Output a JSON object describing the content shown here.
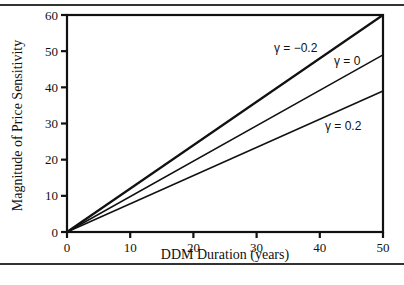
{
  "chart_data": {
    "type": "line",
    "title": "",
    "xlabel": "DDM Duration (years)",
    "ylabel": "Magnitude of Price Sensitivity",
    "xlim": [
      0,
      50
    ],
    "ylim": [
      0,
      60
    ],
    "x_ticks": [
      "0",
      "10",
      "20",
      "30",
      "40",
      "50"
    ],
    "y_ticks": [
      "0",
      "10",
      "20",
      "30",
      "40",
      "50",
      "60"
    ],
    "grid": false,
    "legend": "inline annotations",
    "series": [
      {
        "name": "γ = −0.2",
        "x": [
          0,
          50
        ],
        "values": [
          0,
          60
        ]
      },
      {
        "name": "γ = 0",
        "x": [
          0,
          50
        ],
        "values": [
          0,
          49
        ]
      },
      {
        "name": "γ = 0.2",
        "x": [
          0,
          50
        ],
        "values": [
          0,
          39
        ]
      }
    ],
    "annotations": [
      "γ = −0.2",
      "γ = 0",
      "γ = 0.2"
    ]
  }
}
